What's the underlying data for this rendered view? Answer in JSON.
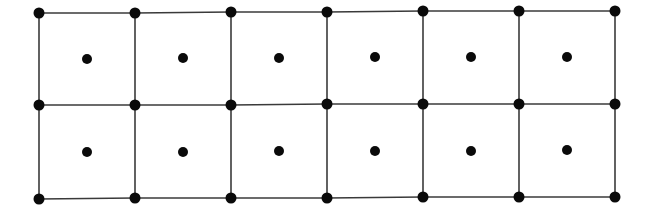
{
  "diagram": {
    "rows": 2,
    "cols": 6,
    "colors": {
      "background": "#ffffff",
      "line": "#3a3a3a",
      "node": "#0a0a0a"
    },
    "corner_node_radius": 5.5,
    "center_node_radius": 5,
    "line_width": 1.6,
    "vertex_x": [
      39,
      135,
      231,
      327,
      423,
      519,
      615
    ],
    "vertex_rows_y": [
      [
        13,
        13,
        12,
        12,
        11,
        11,
        11
      ],
      [
        105,
        105,
        105,
        104,
        104,
        104,
        104
      ],
      [
        199,
        198,
        198,
        198,
        197,
        197,
        197
      ]
    ],
    "cell_centers": [
      [
        [
          87,
          59
        ],
        [
          183,
          58
        ],
        [
          279,
          58
        ],
        [
          375,
          57
        ],
        [
          471,
          57
        ],
        [
          567,
          57
        ]
      ],
      [
        [
          87,
          152
        ],
        [
          183,
          152
        ],
        [
          279,
          151
        ],
        [
          375,
          151
        ],
        [
          471,
          151
        ],
        [
          567,
          150
        ]
      ]
    ]
  }
}
